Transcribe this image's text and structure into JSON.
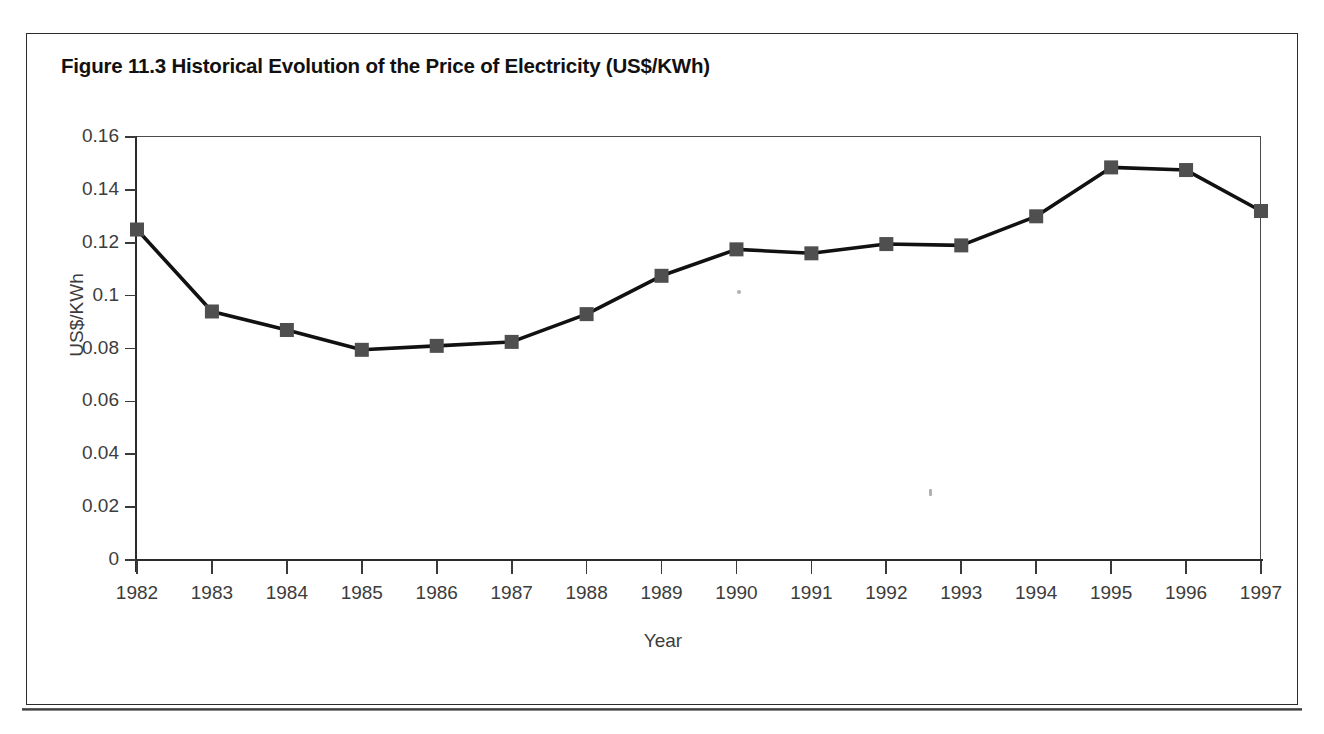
{
  "figure": {
    "title": "Figure 11.3 Historical Evolution of the Price of Electricity (US$/KWh)"
  },
  "chart_data": {
    "type": "line",
    "title": "Figure 11.3 Historical Evolution of the Price of Electricity (US$/KWh)",
    "xlabel": "Year",
    "ylabel": "US$/KWh",
    "categories": [
      "1982",
      "1983",
      "1984",
      "1985",
      "1986",
      "1987",
      "1988",
      "1989",
      "1990",
      "1991",
      "1992",
      "1993",
      "1994",
      "1995",
      "1996",
      "1997"
    ],
    "values": [
      0.125,
      0.094,
      0.087,
      0.0795,
      0.081,
      0.0825,
      0.093,
      0.1075,
      0.1175,
      0.116,
      0.1195,
      0.119,
      0.13,
      0.1485,
      0.1475,
      0.132
    ],
    "series": [
      {
        "name": "Price of Electricity",
        "values": [
          0.125,
          0.094,
          0.087,
          0.0795,
          0.081,
          0.0825,
          0.093,
          0.1075,
          0.1175,
          0.116,
          0.1195,
          0.119,
          0.13,
          0.1485,
          0.1475,
          0.132
        ]
      }
    ],
    "ylim": [
      0,
      0.16
    ],
    "yticks": [
      0,
      0.02,
      0.04,
      0.06,
      0.08,
      0.1,
      0.12,
      0.14,
      0.16
    ],
    "ytick_labels": [
      "0",
      "0.02",
      "0.04",
      "0.06",
      "0.08",
      "0.1",
      "0.12",
      "0.14",
      "0.16"
    ],
    "grid": false,
    "legend": "none",
    "marker": "square",
    "line_color": "#111111",
    "marker_color": "#4f4f4f"
  }
}
